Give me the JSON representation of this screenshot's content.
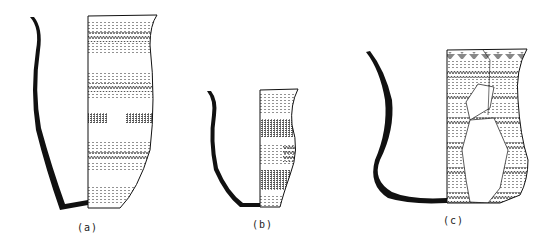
{
  "figure": {
    "vessels": [
      {
        "id": "a",
        "label": "(a)",
        "shape": "tall beaker",
        "decoration": "horizontal bands of dotted and cross-hatched impressed patterns"
      },
      {
        "id": "b",
        "label": "(b)",
        "shape": "squat carinated beaker",
        "decoration": "alternating dotted and dense stippled bands with zig-zag panel"
      },
      {
        "id": "c",
        "label": "(c)",
        "shape": "wide S-profile beaker, restored",
        "decoration": "triangular rim motif and alternating zig-zag and dotted bands; reconstructed areas outlined"
      }
    ]
  },
  "colors": {
    "ink": "#111111",
    "paper": "#ffffff",
    "hatch": "#555555"
  }
}
